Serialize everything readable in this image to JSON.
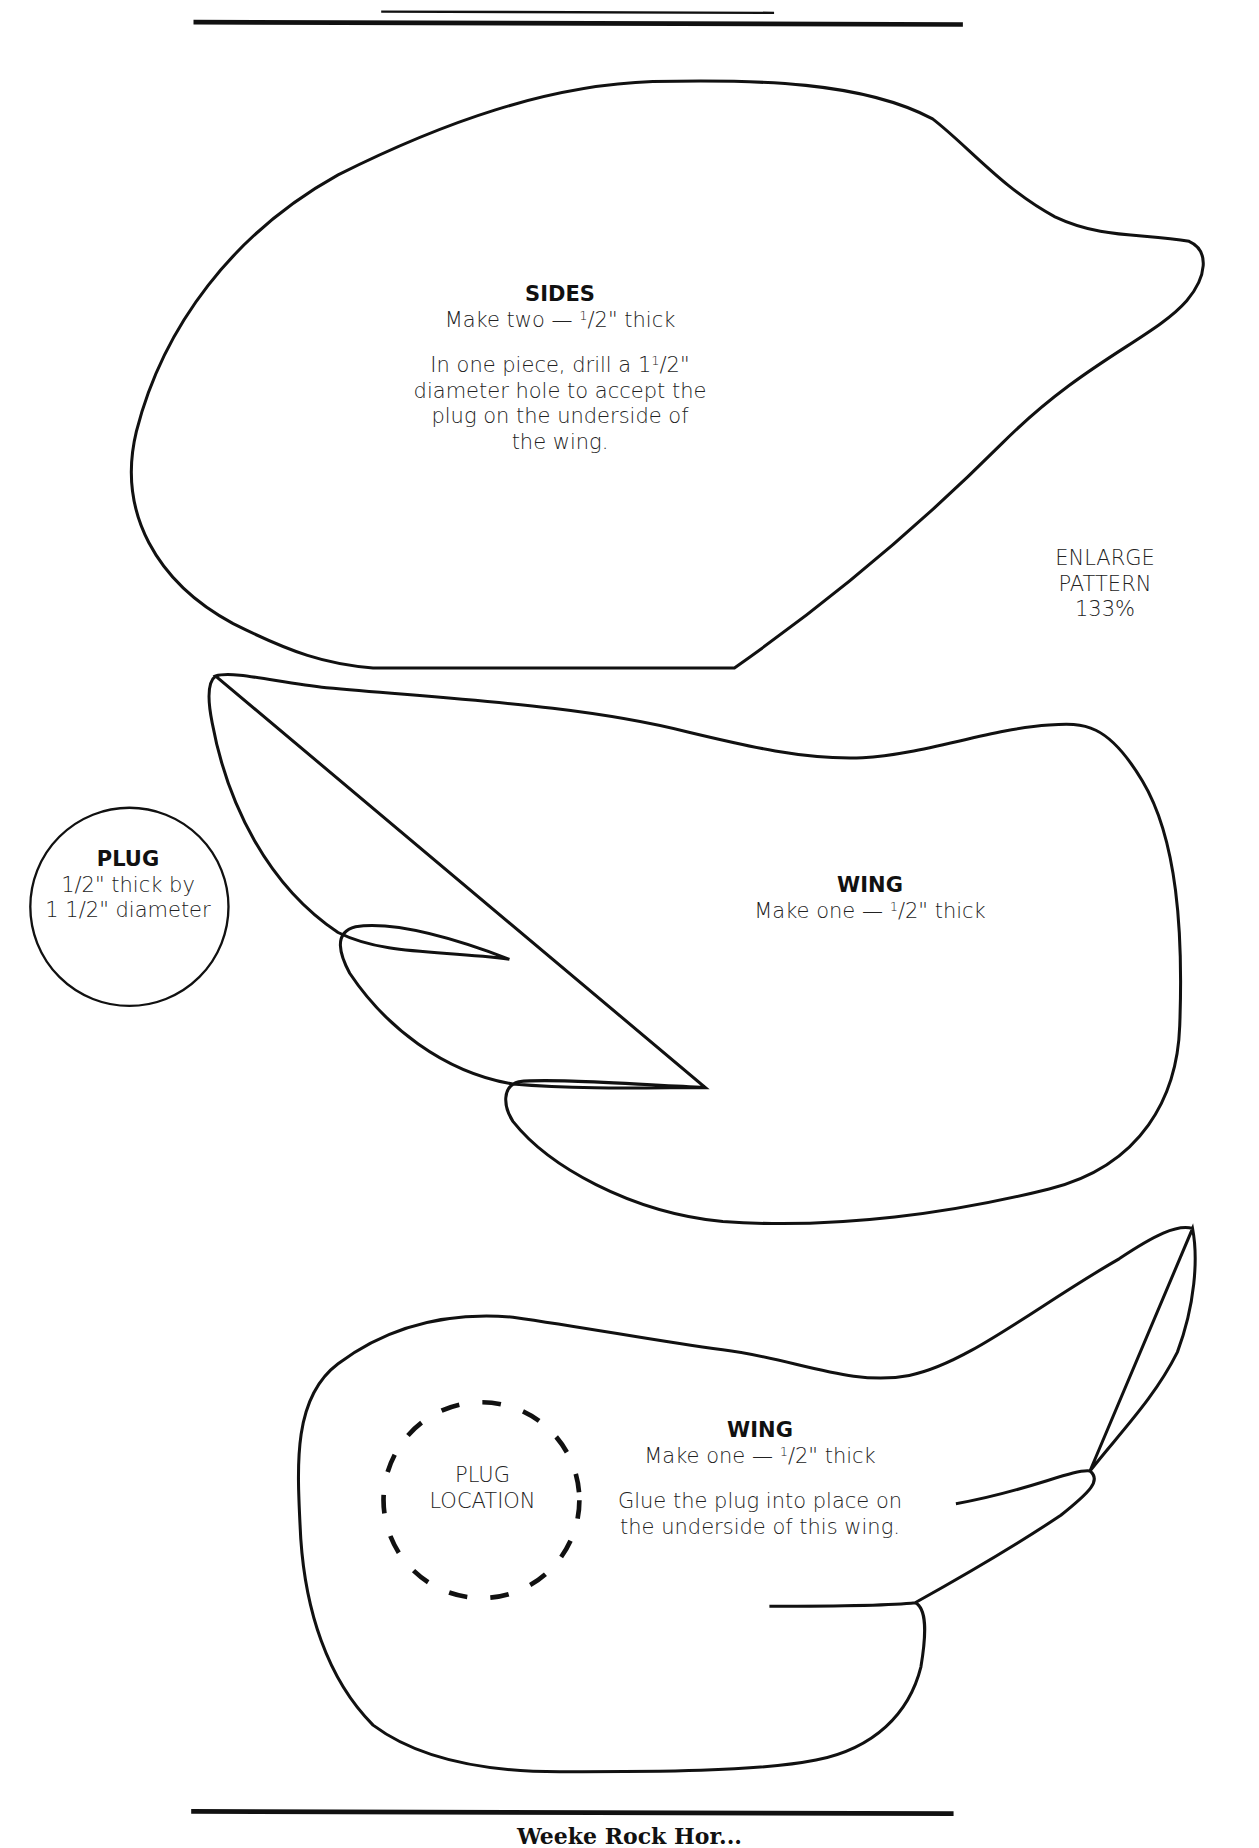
{
  "document": {
    "type": "woodworking pattern sheet",
    "header_rules": [
      "thin-rule",
      "thick-rule"
    ],
    "footer_rule": "thick-rule",
    "footer_text_partial": "Weeke Rock Hor..."
  },
  "notes": {
    "enlarge": {
      "line1": "ENLARGE",
      "line2": "PATTERN",
      "line3": "133%"
    }
  },
  "pieces": {
    "sides": {
      "title": "SIDES",
      "line1_pre": "Make two — ",
      "frac_num": "1",
      "frac_rest": "/2\" thick",
      "desc1_pre": "In one piece, drill a 1",
      "desc1_num": "1",
      "desc1_rest": "/2\"",
      "desc2": "diameter hole to accept the",
      "desc3": "plug on the underside of",
      "desc4": "the wing."
    },
    "plug": {
      "title": "PLUG",
      "line1": "1/2\" thick by",
      "line2": "1 1/2\" diameter"
    },
    "wing_upper": {
      "title": "WING",
      "line1_pre": "Make one — ",
      "frac_num": "1",
      "frac_rest": "/2\" thick"
    },
    "wing_lower": {
      "title": "WING",
      "line1_pre": "Make one — ",
      "frac_num": "1",
      "frac_rest": "/2\" thick",
      "desc1": "Glue the plug into place on",
      "desc2": "the underside of this wing.",
      "plug_location_line1": "PLUG",
      "plug_location_line2": "LOCATION"
    }
  },
  "colors": {
    "ink": "#111111",
    "paper": "#ffffff"
  }
}
